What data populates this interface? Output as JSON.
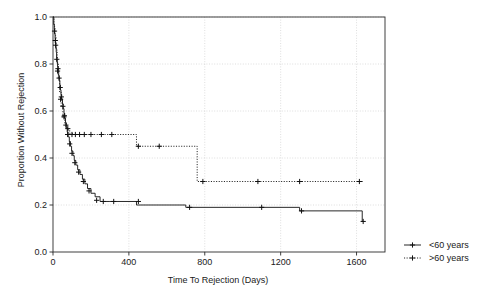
{
  "chart_data": {
    "type": "line",
    "subtype": "kaplan-meier-step",
    "title": "",
    "xlabel": "Time To Rejection (Days)",
    "ylabel": "Proportion Without Rejection",
    "xlim": [
      0,
      1750
    ],
    "ylim": [
      0.0,
      1.0
    ],
    "xticks": [
      0,
      400,
      800,
      1200,
      1600
    ],
    "xticklabels": [
      "0",
      "400",
      "800",
      "1200",
      "1600"
    ],
    "yticks": [
      0.0,
      0.2,
      0.4,
      0.6,
      0.8,
      1.0
    ],
    "yticklabels": [
      "0.0",
      "0.2",
      "0.4",
      "0.6",
      "0.8",
      "1.0"
    ],
    "grid": true,
    "grid_style": "dotted",
    "legend_position": "right-outside",
    "series": [
      {
        "name": "<60 years",
        "style": "solid",
        "steps_x": [
          0,
          4,
          7,
          9,
          11,
          13,
          15,
          17,
          19,
          21,
          24,
          27,
          30,
          33,
          36,
          39,
          42,
          46,
          50,
          54,
          58,
          62,
          66,
          70,
          75,
          80,
          86,
          92,
          98,
          105,
          112,
          120,
          130,
          142,
          155,
          168,
          182,
          200,
          222,
          248,
          300,
          440,
          700,
          1090,
          1300,
          1630
        ],
        "steps_y": [
          1.0,
          0.97,
          0.95,
          0.93,
          0.91,
          0.89,
          0.87,
          0.85,
          0.83,
          0.81,
          0.79,
          0.77,
          0.75,
          0.73,
          0.71,
          0.69,
          0.67,
          0.65,
          0.63,
          0.61,
          0.59,
          0.57,
          0.55,
          0.53,
          0.51,
          0.49,
          0.47,
          0.45,
          0.43,
          0.41,
          0.39,
          0.37,
          0.35,
          0.33,
          0.31,
          0.29,
          0.27,
          0.25,
          0.235,
          0.215,
          0.215,
          0.2,
          0.19,
          0.19,
          0.175,
          0.13
        ],
        "censor_x": [
          8,
          14,
          20,
          26,
          32,
          38,
          44,
          52,
          60,
          68,
          77,
          88,
          100,
          115,
          135,
          160,
          190,
          230,
          265,
          320,
          450,
          720,
          1100,
          1310,
          1635
        ],
        "censor_y": [
          0.94,
          0.88,
          0.82,
          0.78,
          0.74,
          0.7,
          0.66,
          0.62,
          0.58,
          0.54,
          0.5,
          0.46,
          0.42,
          0.38,
          0.34,
          0.3,
          0.26,
          0.22,
          0.215,
          0.215,
          0.215,
          0.19,
          0.19,
          0.175,
          0.13
        ]
      },
      {
        "name": ">60 years",
        "style": "dotted",
        "steps_x": [
          0,
          5,
          10,
          16,
          22,
          28,
          35,
          43,
          52,
          62,
          74,
          88,
          105,
          440,
          760,
          1630
        ],
        "steps_y": [
          1.0,
          0.96,
          0.92,
          0.86,
          0.8,
          0.74,
          0.68,
          0.62,
          0.57,
          0.545,
          0.52,
          0.505,
          0.5,
          0.45,
          0.3,
          0.3
        ],
        "censor_x": [
          12,
          24,
          40,
          58,
          78,
          100,
          118,
          140,
          165,
          200,
          255,
          310,
          450,
          560,
          790,
          1080,
          1300,
          1615
        ],
        "censor_y": [
          0.9,
          0.77,
          0.65,
          0.575,
          0.525,
          0.5,
          0.5,
          0.5,
          0.5,
          0.5,
          0.5,
          0.5,
          0.45,
          0.45,
          0.3,
          0.3,
          0.3,
          0.3
        ]
      }
    ]
  },
  "legend": {
    "items": [
      {
        "label": "<60 years",
        "style": "solid"
      },
      {
        "label": ">60 years",
        "style": "dotted"
      }
    ]
  }
}
